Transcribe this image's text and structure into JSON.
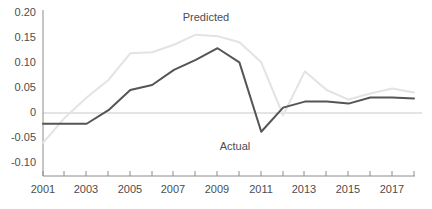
{
  "chart_data": {
    "type": "line",
    "title": "",
    "subtitle": "",
    "xlabel": "",
    "ylabel": "",
    "grid": false,
    "zero_line": true,
    "legend_position": "inline-annotations",
    "x": [
      2001,
      2002,
      2003,
      2004,
      2005,
      2006,
      2007,
      2008,
      2009,
      2010,
      2011,
      2012,
      2013,
      2014,
      2015,
      2016,
      2017,
      2018
    ],
    "xlim": [
      2001,
      2018
    ],
    "ylim": [
      -0.1,
      0.2
    ],
    "yticks": [
      0.2,
      0.15,
      0.1,
      0.05,
      0,
      -0.05,
      -0.1
    ],
    "ytick_labels": [
      "0.20",
      "0.15",
      "0.10",
      "0.05",
      "0",
      "-0.05",
      "-0.10"
    ],
    "xticks": [
      2001,
      2002,
      2003,
      2004,
      2005,
      2006,
      2007,
      2008,
      2009,
      2010,
      2011,
      2012,
      2013,
      2014,
      2015,
      2016,
      2017,
      2018
    ],
    "xtick_labels_shown": [
      "2001",
      "2003",
      "2005",
      "2007",
      "2009",
      "2011",
      "2013",
      "2015",
      "2017"
    ],
    "series": [
      {
        "name": "Actual",
        "color": "#555555",
        "values": [
          -0.022,
          -0.022,
          -0.022,
          0.005,
          0.045,
          0.055,
          0.085,
          0.105,
          0.128,
          0.1,
          -0.038,
          0.01,
          0.022,
          0.022,
          0.018,
          0.03,
          0.03,
          0.028
        ]
      },
      {
        "name": "Predicted",
        "color": "#e3e3e3",
        "values": [
          -0.06,
          -0.01,
          0.03,
          0.065,
          0.118,
          0.12,
          0.135,
          0.155,
          0.152,
          0.14,
          0.1,
          -0.005,
          0.082,
          0.045,
          0.026,
          0.038,
          0.048,
          0.04
        ]
      }
    ],
    "annotations": [
      {
        "text": "Predicted",
        "x": 2010,
        "y": 0.178
      },
      {
        "text": "Actual",
        "x": 2012,
        "y": -0.063
      }
    ]
  },
  "axis": {
    "y_label_0_20": "0.20",
    "y_label_0_15": "0.15",
    "y_label_0_10": "0.10",
    "y_label_0_05": "0.05",
    "y_label_0": "0",
    "y_label_neg_0_05": "-0.05",
    "y_label_neg_0_10": "-0.10",
    "x_label_2001": "2001",
    "x_label_2003": "2003",
    "x_label_2005": "2005",
    "x_label_2007": "2007",
    "x_label_2009": "2009",
    "x_label_2011": "2011",
    "x_label_2013": "2013",
    "x_label_2015": "2015",
    "x_label_2017": "2017"
  },
  "labels": {
    "predicted": "Predicted",
    "actual": "Actual"
  },
  "colors": {
    "actual_line": "#555555",
    "predicted_line": "#e3e3e3",
    "axis": "#8c8c8c",
    "zero_line": "#c9c9c9",
    "text": "#4d4d4d",
    "background": "#ffffff"
  }
}
